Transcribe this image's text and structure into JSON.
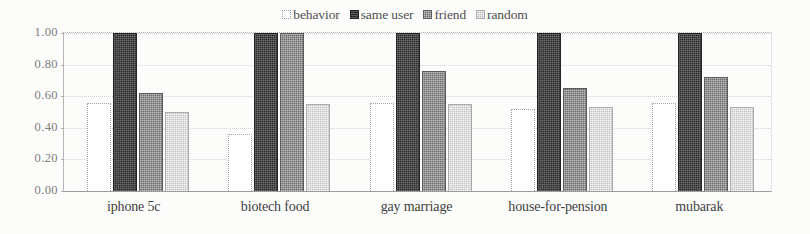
{
  "chart_data": {
    "type": "bar",
    "title": "",
    "xlabel": "",
    "ylabel": "",
    "ylim": [
      0,
      1.0
    ],
    "ytick_labels": [
      "1.00",
      "0.80",
      "0.60",
      "0.40",
      "0.20",
      "0.00"
    ],
    "ytick_values": [
      1.0,
      0.8,
      0.6,
      0.4,
      0.2,
      0.0
    ],
    "grid": true,
    "legend_position": "top-center",
    "categories": [
      "iphone 5c",
      "biotech food",
      "gay marriage",
      "house-for-pension",
      "mubarak"
    ],
    "series": [
      {
        "name": "behavior",
        "swatch": "sw-behavior",
        "color": "#ffffff",
        "values": [
          0.56,
          0.36,
          0.56,
          0.52,
          0.56
        ]
      },
      {
        "name": "same user",
        "swatch": "sw-sameuser",
        "color": "#2c2c2c",
        "values": [
          1.0,
          1.0,
          1.0,
          1.0,
          1.0
        ]
      },
      {
        "name": "friend",
        "swatch": "sw-friend",
        "color": "#6b6b6b",
        "values": [
          0.62,
          1.0,
          0.76,
          0.65,
          0.72
        ]
      },
      {
        "name": "random",
        "swatch": "sw-random",
        "color": "#c2c2c2",
        "values": [
          0.5,
          0.55,
          0.55,
          0.53,
          0.53
        ]
      }
    ]
  },
  "legend": {
    "entries": [
      {
        "label": "behavior",
        "swatch": "sw-behavior"
      },
      {
        "label": "same user",
        "swatch": "sw-sameuser"
      },
      {
        "label": "friend",
        "swatch": "sw-friend"
      },
      {
        "label": "random",
        "swatch": "sw-random"
      }
    ]
  }
}
